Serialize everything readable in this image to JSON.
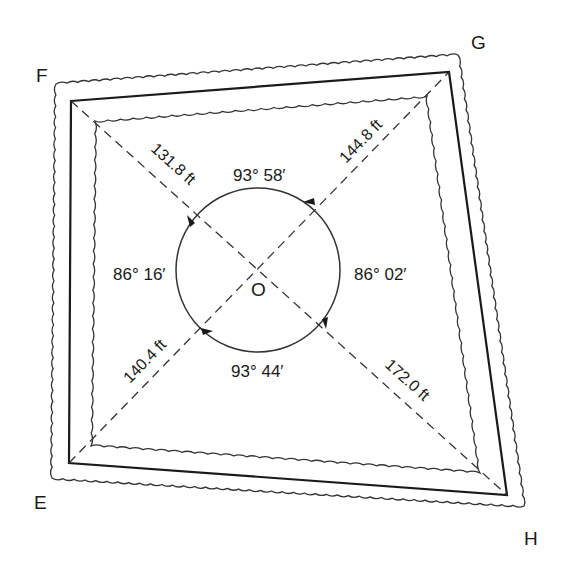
{
  "diagram": {
    "type": "traverse-survey-quadrilateral",
    "corners": {
      "E": "E",
      "F": "F",
      "G": "G",
      "H": "H"
    },
    "center": "O",
    "distances": {
      "OF": "131.8 ft",
      "OG": "144.8 ft",
      "OE": "140.4 ft",
      "OH": "172.0 ft"
    },
    "angles": {
      "FOG": "93° 58′",
      "GOH": "86° 02′",
      "HOE": "93° 44′",
      "EOF": "86° 16′"
    }
  }
}
